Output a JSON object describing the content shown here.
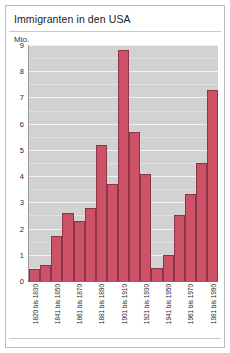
{
  "title": "Immigranten in den USA",
  "unit_label": "Mio.",
  "chart_data": {
    "type": "bar",
    "title": "Immigranten in den USA",
    "subtitle": "",
    "xlabel": "",
    "ylabel": "Mio.",
    "ylim": [
      0,
      9
    ],
    "yticks": [
      0,
      1,
      2,
      3,
      4,
      5,
      6,
      7,
      8,
      9
    ],
    "ytick_labels": [
      "0",
      "1",
      "2",
      "3",
      "4",
      "5",
      "6",
      "7",
      "8",
      "9"
    ],
    "grid": true,
    "legend": "none",
    "bar_color": "#cd5267",
    "bar_edge_color": "#8f3346",
    "plot_background": "#d2d2d2",
    "gridline_color": "#f4f4f4",
    "categories": [
      "1820 bis 1830",
      "1831 bis 1840",
      "1841 bis 1850",
      "1851 bis 1860",
      "1861 bis 1870",
      "1871 bis 1880",
      "1881 bis 1890",
      "1891 bis 1900",
      "1901 bis 1910",
      "1911 bis 1920",
      "1921 bis 1930",
      "1931 bis 1940",
      "1941 bis 1950",
      "1951 bis 1960",
      "1961 bis 1970",
      "1971 bis 1980",
      "1981 bis 1990"
    ],
    "tick_labels_shown": [
      "1820 bis 1830",
      "",
      "1841 bis 1850",
      "",
      "1861 bis 1870",
      "",
      "1881 bis 1890",
      "",
      "1901 bis 1910",
      "",
      "1921 bis 1930",
      "",
      "1941 bis 1950",
      "",
      "1961 bis 1970",
      "",
      "1981 bis 1990"
    ],
    "values": [
      0.45,
      0.6,
      1.7,
      2.6,
      2.3,
      2.8,
      5.2,
      3.7,
      8.8,
      5.7,
      4.1,
      0.5,
      1.0,
      2.5,
      3.3,
      4.5,
      7.3
    ]
  }
}
